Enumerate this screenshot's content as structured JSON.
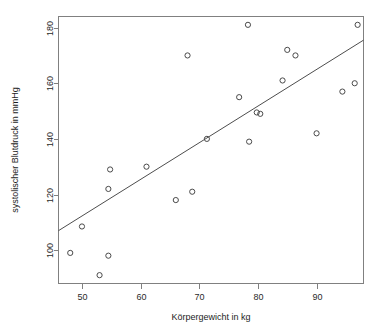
{
  "chart_data": {
    "type": "scatter",
    "title": "",
    "xlabel": "Körpergewicht in kg",
    "ylabel": "systolischer Blutdruck in mmHg",
    "xlim": [
      46,
      98
    ],
    "ylim": [
      88,
      184
    ],
    "grid": false,
    "legend": null,
    "x_ticks": [
      50,
      60,
      70,
      80,
      90
    ],
    "x_tick_labels": [
      "50",
      "60",
      "70",
      "80",
      "90"
    ],
    "y_ticks": [
      100,
      120,
      140,
      160,
      180
    ],
    "y_tick_labels": [
      "100",
      "120",
      "140",
      "160",
      "180"
    ],
    "point_marker": "open-circle",
    "point_color": "#4a4a4a",
    "line_color": "#4d4d4d",
    "series": [
      {
        "name": "Messwerte",
        "x": [
          48.0,
          50.0,
          53.0,
          54.5,
          54.5,
          54.8,
          61.0,
          66.0,
          68.0,
          68.8,
          71.3,
          76.8,
          78.3,
          78.5,
          79.8,
          80.4,
          84.2,
          85.0,
          86.4,
          90.0,
          94.4,
          96.5,
          97.0
        ],
        "y": [
          99.0,
          108.5,
          91.0,
          98.0,
          122.0,
          129.0,
          130.0,
          118.0,
          170.0,
          121.0,
          140.0,
          155.0,
          181.0,
          139.0,
          149.5,
          149.0,
          161.0,
          172.0,
          170.0,
          142.0,
          157.0,
          160.0,
          181.0
        ]
      }
    ],
    "regression_line": {
      "name": "Regressionsgerade",
      "x": [
        46.0,
        98.0
      ],
      "y": [
        107.0,
        175.5
      ]
    }
  }
}
